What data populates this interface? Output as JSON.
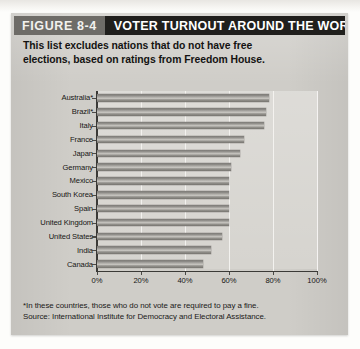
{
  "figure": {
    "number_label": "FIGURE 8-4",
    "title": "VOTER TURNOUT AROUND THE WORLD",
    "subtitle_line1": "This list excludes nations that do not have free",
    "subtitle_line2": "elections, based on ratings from Freedom House.",
    "footnote": "*In these countries, those who do not vote are required to pay a fine.",
    "source": "Source: International Institute for Democracy and  Electoral Assistance."
  },
  "colors": {
    "panel_background": "#cfcdc8",
    "plot_background": "#d6d4cf",
    "figure_number_box": "#6e6c68",
    "title_box": "#201f1d",
    "title_text": "#ffffff",
    "bar_fill": "#96948f",
    "axis": "#3b3a37",
    "gridline": "#f4f3f0",
    "text": "#171614"
  },
  "chart_data": {
    "type": "bar",
    "orientation": "horizontal",
    "title": "VOTER TURNOUT AROUND THE WORLD",
    "subtitle": "This list excludes nations that do not have free elections, based on ratings from Freedom House.",
    "xlabel": "",
    "ylabel": "",
    "xlim": [
      0,
      100
    ],
    "grid": true,
    "legend": "none",
    "x_tick_labels": [
      "0%",
      "20%",
      "40%",
      "60%",
      "80%",
      "100%"
    ],
    "x_tick_values": [
      0,
      20,
      40,
      60,
      80,
      100
    ],
    "categories": [
      "Australia*",
      "Brazil*",
      "Italy",
      "France",
      "Japan",
      "Germany",
      "Mexico",
      "South Korea",
      "Spain",
      "United Kingdom",
      "United States",
      "India",
      "Canada"
    ],
    "values": [
      78,
      77,
      76,
      67,
      65,
      61,
      60,
      60,
      60,
      60,
      57,
      52,
      48
    ],
    "units": "percent",
    "annotations": [
      "*In these countries, those who do not vote are required to pay a fine.",
      "Source: International Institute for Democracy and  Electoral Assistance."
    ]
  }
}
